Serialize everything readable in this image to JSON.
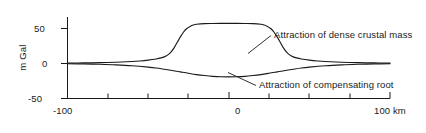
{
  "chart_data": {
    "type": "line",
    "title": "",
    "xlabel": "100 km",
    "ylabel": "m Gal",
    "xlim": [
      -100,
      100
    ],
    "ylim": [
      -50,
      75
    ],
    "grid": false,
    "legend_position": "inline-annotations",
    "x_ticks": [
      -100,
      -87.5,
      -75,
      -62.5,
      -50,
      -37.5,
      -25,
      -12.5,
      0,
      12.5,
      25,
      37.5,
      50,
      62.5,
      75,
      87.5,
      100
    ],
    "x_tick_labels": [
      "-100",
      "",
      "",
      "",
      "",
      "",
      "",
      "",
      "0",
      "",
      "",
      "",
      "",
      "",
      "",
      "",
      "100 km"
    ],
    "y_ticks": [
      -50,
      0,
      50
    ],
    "y_tick_labels": [
      "-50",
      "0",
      "50"
    ],
    "series": [
      {
        "name": "Attraction of dense crustal mass",
        "x": [
          -100,
          -90,
          -80,
          -70,
          -60,
          -55,
          -50,
          -45,
          -42,
          -40,
          -38,
          -36,
          -34,
          -32,
          -30,
          -28,
          -26,
          -24,
          -22,
          -20,
          -15,
          -10,
          -5,
          0,
          5,
          10,
          15,
          20,
          22,
          24,
          26,
          28,
          30,
          32,
          34,
          36,
          38,
          40,
          42,
          45,
          50,
          55,
          60,
          70,
          80,
          90,
          100
        ],
        "y": [
          0.5,
          0.8,
          1.2,
          1.8,
          2.8,
          3.6,
          4.8,
          6.5,
          8.0,
          9.5,
          12.0,
          16.0,
          22.0,
          30.0,
          38.0,
          45.0,
          50.0,
          53.0,
          55.0,
          56.0,
          57.0,
          57.2,
          57.3,
          57.3,
          57.3,
          57.2,
          57.0,
          56.0,
          55.0,
          53.0,
          50.0,
          45.0,
          38.0,
          30.0,
          22.0,
          16.0,
          12.0,
          9.5,
          8.0,
          6.5,
          4.8,
          3.6,
          2.8,
          1.8,
          1.2,
          0.8,
          0.5
        ]
      },
      {
        "name": "Attraction of compensating root",
        "x": [
          -100,
          -90,
          -80,
          -70,
          -60,
          -50,
          -45,
          -40,
          -35,
          -30,
          -25,
          -20,
          -15,
          -10,
          -5,
          0,
          5,
          10,
          15,
          20,
          25,
          30,
          35,
          40,
          45,
          50,
          60,
          70,
          80,
          90,
          100
        ],
        "y": [
          -0.3,
          -0.6,
          -1.1,
          -1.9,
          -3.2,
          -5.2,
          -6.5,
          -8.2,
          -10.0,
          -12.0,
          -14.0,
          -15.8,
          -17.2,
          -18.3,
          -18.9,
          -19.1,
          -18.9,
          -18.3,
          -17.2,
          -15.8,
          -14.0,
          -12.0,
          -10.0,
          -8.2,
          -6.5,
          -5.2,
          -3.2,
          -1.9,
          -1.1,
          -0.6,
          -0.3
        ]
      }
    ],
    "annotations": [
      {
        "id": "crust",
        "text": "Attraction of dense crustal mass",
        "anchor_x": 34,
        "anchor_y": 38
      },
      {
        "id": "root",
        "text": "Attraction of compensating root",
        "anchor_x": -5,
        "anchor_y": -19
      }
    ],
    "colors": {
      "line": "#1a1a1a",
      "axis": "#1a1a1a",
      "background": "#ffffff"
    }
  },
  "axes": {
    "ylabel": "m Gal",
    "y_tick_50": "50",
    "y_tick_0": "0",
    "y_tick_m50": "-50",
    "x_tick_m100": "-100",
    "x_tick_0": "0",
    "x_tick_100": "100 km"
  },
  "annotations": {
    "crustal_mass": "Attraction of dense crustal mass",
    "compensating_root": "Attraction of compensating root"
  }
}
